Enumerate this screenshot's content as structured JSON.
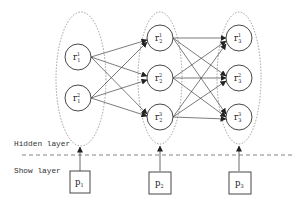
{
  "diagram": {
    "type": "layered-network",
    "layers": {
      "hidden_label": "Hidden layer",
      "show_label": "Show layer"
    },
    "groups": [
      {
        "id": "g1",
        "input": {
          "label": "p",
          "sub": "1"
        },
        "nodes": [
          {
            "label": "r",
            "sup": "1",
            "sub": "1"
          },
          {
            "label": "r",
            "sup": "2",
            "sub": "1"
          }
        ]
      },
      {
        "id": "g2",
        "input": {
          "label": "p",
          "sub": "2"
        },
        "nodes": [
          {
            "label": "r",
            "sup": "1",
            "sub": "2"
          },
          {
            "label": "r",
            "sup": "2",
            "sub": "2"
          },
          {
            "label": "r",
            "sup": "3",
            "sub": "2"
          }
        ]
      },
      {
        "id": "g3",
        "input": {
          "label": "p",
          "sub": "3"
        },
        "nodes": [
          {
            "label": "r",
            "sup": "1",
            "sub": "3"
          },
          {
            "label": "r",
            "sup": "2",
            "sub": "3"
          },
          {
            "label": "r",
            "sup": "3",
            "sub": "3"
          }
        ]
      }
    ],
    "edges_description": "Fully connected: every node in group 1 points to every node in group 2; every node in group 2 points to every node in group 3. Each input box p_i points up to its group ellipse.",
    "colors": {
      "stroke": "#333333",
      "dashed": "#777777",
      "background": "#ffffff"
    }
  }
}
